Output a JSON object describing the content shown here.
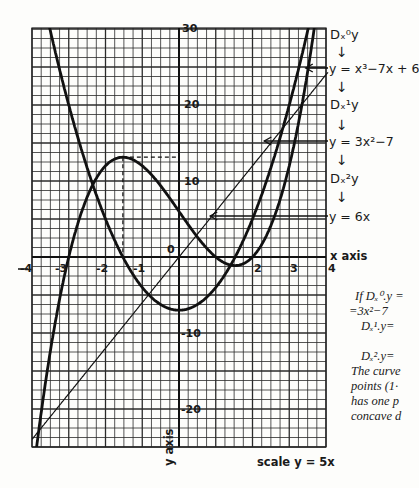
{
  "figure": {
    "title": "",
    "x_axis_label": "x axis",
    "y_axis_label": "y axis",
    "scale_note": "scale y = 5x",
    "x_ticks": [
      "-4",
      "-3",
      "-2",
      "-1",
      "0",
      "2",
      "3",
      "4"
    ],
    "y_ticks": [
      "30",
      "20",
      "10",
      "-10",
      "-20"
    ]
  },
  "derivative_chain": {
    "d0": "Dₓ⁰y",
    "f": "y = x³−7x + 6",
    "d1": "Dₓ¹y",
    "f1": "y = 3x²−7",
    "d2": "Dₓ²y",
    "f2": "y = 6x",
    "arrow": "↓"
  },
  "margin_text": {
    "line1": "If Dₓ⁰.y =",
    "line2": "=3x²−7",
    "line3": "Dₓ¹.y=",
    "line4": "Dₓ².y=",
    "line5": "The curve",
    "line6": "points (1·",
    "line7": "has one p",
    "line8": "concave d"
  },
  "chart_data": {
    "type": "line",
    "title": "",
    "xlabel": "x axis",
    "ylabel": "y axis",
    "xlim": [
      -4,
      4
    ],
    "ylim": [
      -25,
      30
    ],
    "grid": true,
    "series": [
      {
        "name": "y = x^3 - 7x + 6",
        "expr": "x^3-7x+6",
        "style": "thick",
        "points": [
          [
            -3.3,
            -6.8
          ],
          [
            -3,
            0
          ],
          [
            -2,
            12
          ],
          [
            -1.53,
            13.1
          ],
          [
            -1,
            12
          ],
          [
            0,
            6
          ],
          [
            1,
            0
          ],
          [
            1.53,
            -1.1
          ],
          [
            2,
            0
          ],
          [
            3,
            12
          ],
          [
            3.4,
            21
          ]
        ]
      },
      {
        "name": "y = 3x^2 - 7",
        "expr": "3x^2-7",
        "style": "thick",
        "points": [
          [
            -3.5,
            29.75
          ],
          [
            -3,
            20
          ],
          [
            -2,
            5
          ],
          [
            -1,
            -4
          ],
          [
            0,
            -7
          ],
          [
            1,
            -4
          ],
          [
            2,
            5
          ],
          [
            3,
            20
          ],
          [
            3.5,
            29.75
          ]
        ]
      },
      {
        "name": "y = 6x",
        "expr": "6x",
        "style": "thin",
        "points": [
          [
            -4,
            -24
          ],
          [
            0,
            0
          ],
          [
            4,
            24
          ]
        ]
      }
    ],
    "annotations": [
      {
        "type": "dashed",
        "desc": "local max of y=x^3-7x+6 at x≈-1.53, y≈13.1"
      }
    ]
  }
}
